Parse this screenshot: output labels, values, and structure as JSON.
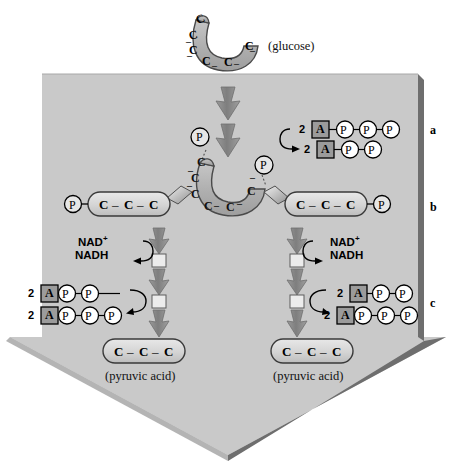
{
  "figure": {
    "background_color": "#ffffff",
    "panel_color": "#c9c9c9",
    "panel_edge_color": "#5a5a5a",
    "molecule_fill": "#b4b4b4",
    "capsule_fill": "#d8d8d8",
    "arrow_gray": "#8d8d8d"
  },
  "glucose": {
    "label": "(glucose)",
    "carbons": [
      "C",
      "C",
      "C",
      "C",
      "C",
      "C"
    ],
    "carbon_count": 6
  },
  "sections": {
    "a": "a",
    "b": "b",
    "c": "c"
  },
  "step_a": {
    "atp_count": "2",
    "atp_adenosine": "A",
    "atp_phosphates": [
      "P",
      "P",
      "P"
    ],
    "adp_count": "2",
    "adp_adenosine": "A",
    "adp_phosphates": [
      "P",
      "P"
    ],
    "dash": "-"
  },
  "step_b": {
    "phosphate_left_on_glucose": "P",
    "phosphate_right_on_glucose": "P",
    "left_branch": {
      "phosphate": "P",
      "carbons": [
        "C",
        "C",
        "C"
      ],
      "separator": "–"
    },
    "right_branch": {
      "phosphate": "P",
      "carbons": [
        "C",
        "C",
        "C"
      ],
      "separator": "–"
    },
    "nad_left": {
      "oxidized": "NAD",
      "oxidized_charge": "+",
      "reduced": "NADH"
    },
    "nad_right": {
      "oxidized": "NAD",
      "oxidized_charge": "+",
      "reduced": "NADH"
    }
  },
  "step_c": {
    "left": {
      "adp_count": "2",
      "adp_adenosine": "A",
      "adp_phosphates": [
        "P",
        "P"
      ],
      "atp_count": "2",
      "atp_adenosine": "A",
      "atp_phosphates": [
        "P",
        "P",
        "P"
      ]
    },
    "right": {
      "adp_count": "2",
      "adp_adenosine": "A",
      "adp_phosphates": [
        "P",
        "P"
      ],
      "atp_count": "2",
      "atp_adenosine": "A",
      "atp_phosphates": [
        "P",
        "P",
        "P"
      ]
    }
  },
  "products": {
    "left": {
      "carbons": [
        "C",
        "C",
        "C"
      ],
      "separator": "–",
      "caption": "(pyruvic acid)"
    },
    "right": {
      "carbons": [
        "C",
        "C",
        "C"
      ],
      "separator": "–",
      "caption": "(pyruvic acid)"
    }
  }
}
